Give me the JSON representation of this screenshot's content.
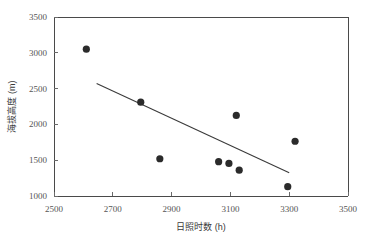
{
  "chart_data": {
    "type": "scatter",
    "title": "",
    "xlabel": "日照时数 (h)",
    "ylabel": "海拔高度 (m)",
    "xlim": [
      2500,
      3500
    ],
    "ylim": [
      1000,
      3500
    ],
    "xticks": [
      2500,
      2700,
      2900,
      3100,
      3300,
      3500
    ],
    "yticks": [
      1000,
      1500,
      2000,
      2500,
      3000,
      3500
    ],
    "xtick_labels": [
      "2500",
      "2700",
      "2900",
      "3100",
      "3300",
      "3500"
    ],
    "ytick_labels": [
      "1000",
      "1500",
      "2000",
      "2500",
      "3000",
      "3500"
    ],
    "grid": false,
    "legend": null,
    "marker": "filled-circle",
    "marker_color": "#2b2b2b",
    "points": [
      {
        "x": 2610,
        "y": 3050
      },
      {
        "x": 2795,
        "y": 2310
      },
      {
        "x": 2860,
        "y": 1520
      },
      {
        "x": 3060,
        "y": 1480
      },
      {
        "x": 3095,
        "y": 1455
      },
      {
        "x": 3130,
        "y": 1360
      },
      {
        "x": 3120,
        "y": 2125
      },
      {
        "x": 3320,
        "y": 1765
      },
      {
        "x": 3295,
        "y": 1130
      }
    ],
    "trend_line": {
      "type": "linear",
      "color": "#3a3a3a",
      "start": {
        "x": 2645,
        "y": 2570
      },
      "end": {
        "x": 3300,
        "y": 1325
      }
    }
  },
  "axes": {
    "x_title": "日照时数 (h)",
    "y_title": "海拔高度 (m)"
  }
}
